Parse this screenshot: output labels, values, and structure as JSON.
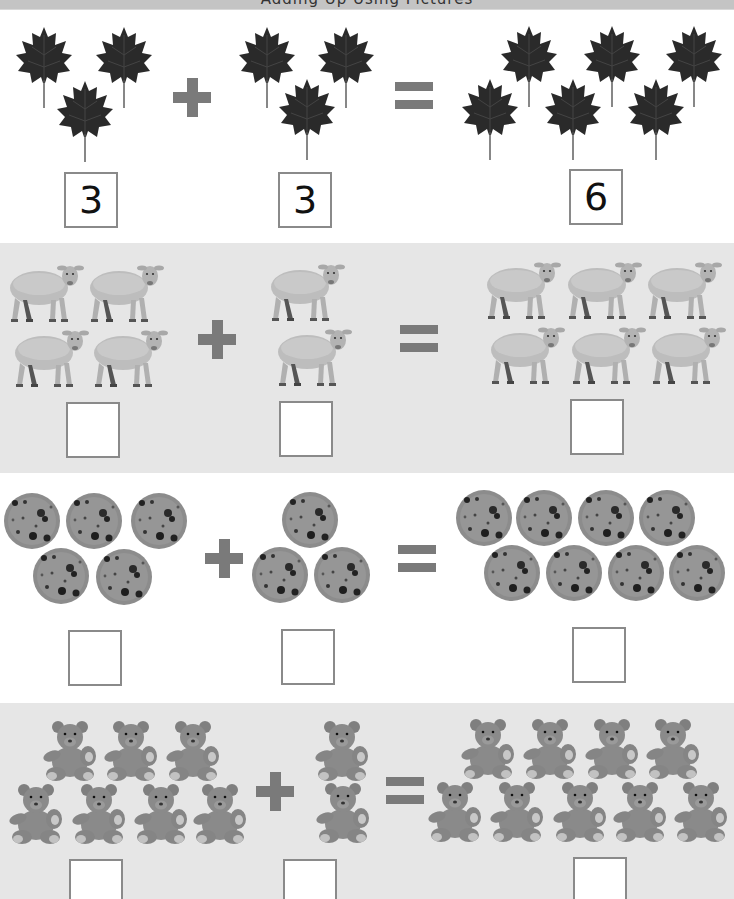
{
  "worksheet": {
    "title": "Adding Up Using Pictures",
    "operators": {
      "plus": "+",
      "equals": "="
    },
    "rows": [
      {
        "subject": "leaf",
        "background": "#ffffff",
        "left": {
          "count": 3,
          "answer": "3"
        },
        "right": {
          "count": 3,
          "answer": "3"
        },
        "result": {
          "count": 6,
          "answer": "6"
        }
      },
      {
        "subject": "sheep",
        "background": "#e6e6e6",
        "left": {
          "count": 4,
          "answer": ""
        },
        "right": {
          "count": 2,
          "answer": ""
        },
        "result": {
          "count": 6,
          "answer": ""
        }
      },
      {
        "subject": "cookie",
        "background": "#ffffff",
        "left": {
          "count": 5,
          "answer": ""
        },
        "right": {
          "count": 3,
          "answer": ""
        },
        "result": {
          "count": 8,
          "answer": ""
        }
      },
      {
        "subject": "teddy-bear",
        "background": "#e6e6e6",
        "left": {
          "count": 7,
          "answer": ""
        },
        "right": {
          "count": 2,
          "answer": ""
        },
        "result": {
          "count": 9,
          "answer": ""
        }
      }
    ]
  },
  "colors": {
    "operator": "#7a7a7a",
    "box_border": "#8a8a8a",
    "band_gray": "#e6e6e6",
    "leaf": "#2a2a2a",
    "sheep": "#bdbdbd",
    "cookie": "#8c8c8c",
    "bear": "#8a8a8a"
  }
}
